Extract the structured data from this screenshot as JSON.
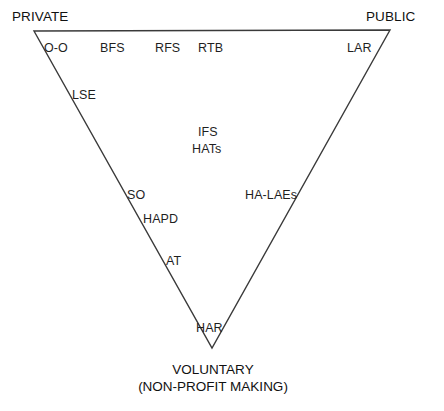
{
  "diagram": {
    "type": "ternary-triangle",
    "stroke_color": "#3a3a3a",
    "background_color": "#ffffff",
    "poles": {
      "private": "PRIVATE",
      "public": "PUBLIC",
      "voluntary_line1": "VOLUNTARY",
      "voluntary_line2": "(NON-PROFIT MAKING)"
    },
    "items": [
      {
        "id": "o-o",
        "label": "O-O",
        "x": 44,
        "y": 42
      },
      {
        "id": "bfs",
        "label": "BFS",
        "x": 100,
        "y": 42
      },
      {
        "id": "rfs",
        "label": "RFS",
        "x": 155,
        "y": 42
      },
      {
        "id": "rtb",
        "label": "RTB",
        "x": 198,
        "y": 42
      },
      {
        "id": "lar",
        "label": "LAR",
        "x": 347,
        "y": 42
      },
      {
        "id": "lse",
        "label": "LSE",
        "x": 72,
        "y": 89
      },
      {
        "id": "ifs",
        "label": "IFS",
        "x": 198,
        "y": 126
      },
      {
        "id": "hats",
        "label": "HATs",
        "x": 192,
        "y": 143
      },
      {
        "id": "so",
        "label": "SO",
        "x": 127,
        "y": 189
      },
      {
        "id": "ha-laes",
        "label": "HA-LAEs",
        "x": 245,
        "y": 189
      },
      {
        "id": "hapd",
        "label": "HAPD",
        "x": 143,
        "y": 213
      },
      {
        "id": "at",
        "label": "AT",
        "x": 166,
        "y": 255
      },
      {
        "id": "har",
        "label": "HAR",
        "x": 196,
        "y": 322
      }
    ]
  }
}
